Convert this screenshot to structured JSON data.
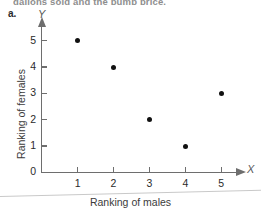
{
  "page": {
    "top_text_fragment": "gallons sold and the pump price.",
    "part_label": "a."
  },
  "chart_data": {
    "type": "scatter",
    "title": "",
    "subtitle": "",
    "xlabel": "Ranking of males",
    "ylabel": "Ranking of females",
    "x_axis_name": "X",
    "y_axis_name": "Y",
    "x": [
      1,
      2,
      3,
      4,
      5
    ],
    "y": [
      5,
      4,
      2,
      1,
      3
    ],
    "points": [
      {
        "x": 1,
        "y": 5
      },
      {
        "x": 2,
        "y": 4
      },
      {
        "x": 3,
        "y": 2
      },
      {
        "x": 4,
        "y": 1
      },
      {
        "x": 5,
        "y": 3
      }
    ],
    "xlim": [
      0,
      5.6
    ],
    "ylim": [
      0,
      5.6
    ],
    "xticks": [
      1,
      2,
      3,
      4,
      5
    ],
    "yticks": [
      0,
      1,
      2,
      3,
      4,
      5
    ],
    "xtick_labels": [
      "1",
      "2",
      "3",
      "4",
      "5"
    ],
    "ytick_labels": [
      "0",
      "1",
      "2",
      "3",
      "4",
      "5"
    ],
    "grid": false,
    "legend": null,
    "marker_color": "#111111",
    "axis_color": "#6e6e6e"
  }
}
